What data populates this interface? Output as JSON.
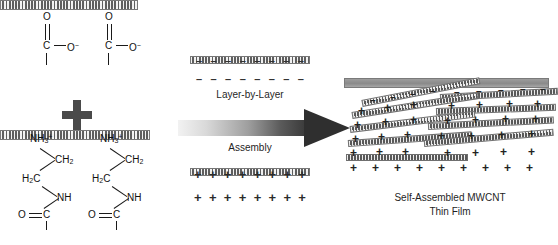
{
  "figure": {
    "title": "Layer-by-Layer Assembly of Self-Assembled MWCNT Thin Film",
    "process_label_line1": "Layer-by-Layer",
    "process_label_line2": "Assembly",
    "product_label_line1": "Self-Assembled MWCNT",
    "product_label_line2": "Thin Film",
    "plus_operator": "+"
  },
  "reactant_carboxylate": {
    "name": "carboxylate-functionalized-nanotube",
    "groups": [
      {
        "oxygen_double": "O",
        "carbon": "C",
        "oxygen_anion": "O",
        "charge": "−"
      },
      {
        "oxygen_double": "O",
        "carbon": "C",
        "oxygen_anion": "O",
        "charge": "−"
      }
    ]
  },
  "reactant_amine": {
    "name": "amine-functionalized-nanotube",
    "groups": [
      {
        "ammonium": "NH",
        "ammonium_sub": "3",
        "ammonium_charge": "+",
        "ch2_upper": "CH",
        "ch2_upper_sub": "2",
        "ch2_lower": "H",
        "ch2_lower_sub": "2",
        "ch2_lower_c": "C",
        "amide_nh": "NH",
        "carbonyl_o": "O",
        "carbonyl_c": "C"
      },
      {
        "ammonium": "NH",
        "ammonium_sub": "3",
        "ammonium_charge": "+",
        "ch2_upper": "CH",
        "ch2_upper_sub": "2",
        "ch2_lower": "H",
        "ch2_lower_sub": "2",
        "ch2_lower_c": "C",
        "amide_nh": "NH",
        "carbonyl_o": "O",
        "carbonyl_c": "C"
      }
    ]
  },
  "middle_layers": {
    "negative_layer": {
      "charge_symbol": "–",
      "count_top": 8,
      "count_bottom": 8
    },
    "positive_layer": {
      "charge_symbol": "+",
      "count_top": 8,
      "count_bottom": 8
    }
  },
  "assembled_film": {
    "tube_count": 9,
    "positive_symbol": "+",
    "negative_symbol": "–",
    "substrate": "solid-gray-substrate"
  },
  "colors": {
    "ink": "#1a1a1a",
    "bar_fill": "#9a9a9a",
    "bar_stroke": "#777777",
    "arrow_light": "#f2f2f2",
    "arrow_dark": "#2f2f2f",
    "background": "#ffffff"
  }
}
